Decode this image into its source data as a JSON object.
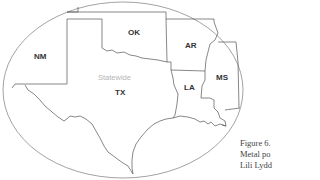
{
  "map": {
    "region_label": "Statewide",
    "states": [
      {
        "code": "NM",
        "x": 34,
        "y": 53
      },
      {
        "code": "OK",
        "x": 128,
        "y": 29
      },
      {
        "code": "AR",
        "x": 185,
        "y": 42
      },
      {
        "code": "TX",
        "x": 115,
        "y": 89
      },
      {
        "code": "LA",
        "x": 184,
        "y": 84
      },
      {
        "code": "MS",
        "x": 216,
        "y": 74
      }
    ],
    "colors": {
      "outline": "#555555",
      "ellipse": "#888888",
      "region_label": "#b5b5b5",
      "state_label": "#333333"
    }
  },
  "caption": {
    "lines": [
      "Figure 6.",
      "Metal po",
      "Lili Lydd"
    ]
  }
}
